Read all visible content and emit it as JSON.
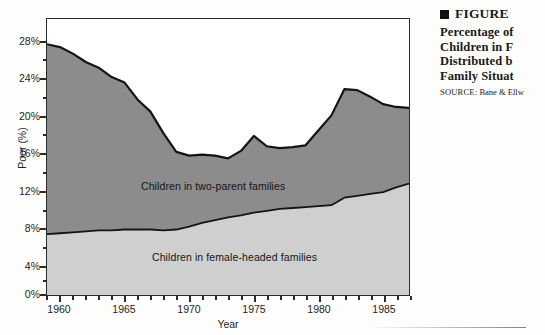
{
  "caption": {
    "figure_label": "FIGURE",
    "lines": [
      "Percentage of",
      "Children in F",
      "Distributed b",
      "Family Situat"
    ],
    "source_tag": "SOURCE:",
    "source_text": "Bane & Ellw"
  },
  "chart_data": {
    "type": "area",
    "stacked": true,
    "title": "",
    "xlabel": "Year",
    "ylabel": "Poor (%)",
    "xlim": [
      1959,
      1987
    ],
    "ylim": [
      0,
      29.5
    ],
    "grid": false,
    "legend_position": "inline-labels",
    "x_tick_labels": [
      "1960",
      "1965",
      "1970",
      "1975",
      "1980",
      "1985"
    ],
    "x_tick_values": [
      1960,
      1965,
      1970,
      1975,
      1980,
      1985
    ],
    "x_minor_tick_interval": 1,
    "y_tick_labels": [
      "0%",
      "4%",
      "8%",
      "12%",
      "16%",
      "20%",
      "24%",
      "28%"
    ],
    "y_tick_values": [
      0,
      4,
      8,
      12,
      16,
      20,
      24,
      28
    ],
    "y_minor_tick_interval": 2,
    "colors": {
      "two_parent": "#8c8c8c",
      "female_headed": "#cfcfcf",
      "outline": "#141414",
      "frame": "#2b2b2b",
      "background": "#ffffff"
    },
    "x": [
      1959,
      1960,
      1961,
      1962,
      1963,
      1964,
      1965,
      1966,
      1967,
      1968,
      1969,
      1970,
      1971,
      1972,
      1973,
      1974,
      1975,
      1976,
      1977,
      1978,
      1979,
      1980,
      1981,
      1982,
      1983,
      1984,
      1985,
      1986,
      1987
    ],
    "series": [
      {
        "name": "Children in female-headed families",
        "label": "Children in female-headed families",
        "color": "#cfcfcf",
        "values": [
          6.5,
          6.6,
          6.7,
          6.8,
          6.9,
          6.9,
          7.0,
          7.0,
          7.0,
          6.9,
          7.0,
          7.3,
          7.7,
          8.0,
          8.3,
          8.5,
          8.8,
          9.0,
          9.2,
          9.3,
          9.4,
          9.5,
          9.6,
          10.4,
          10.6,
          10.8,
          11.0,
          11.5,
          11.9
        ]
      },
      {
        "name": "Children in two-parent families",
        "label": "Children in two-parent families",
        "color": "#8c8c8c",
        "values": [
          20.3,
          19.9,
          19.1,
          18.1,
          17.4,
          16.4,
          15.7,
          13.9,
          12.6,
          10.4,
          8.3,
          7.6,
          7.3,
          6.9,
          6.3,
          6.9,
          8.2,
          6.9,
          6.5,
          6.5,
          6.6,
          8.1,
          9.6,
          11.6,
          11.3,
          10.4,
          9.4,
          8.6,
          8.1
        ]
      }
    ],
    "total_series": {
      "name": "Total children in poverty",
      "values": [
        26.8,
        26.5,
        25.8,
        24.9,
        24.3,
        23.3,
        22.7,
        20.9,
        19.6,
        17.3,
        15.3,
        14.9,
        15.0,
        14.9,
        14.6,
        15.4,
        17.0,
        15.9,
        15.7,
        15.8,
        16.0,
        17.6,
        19.2,
        22.0,
        21.9,
        21.2,
        20.4,
        20.1,
        20.0
      ]
    }
  }
}
